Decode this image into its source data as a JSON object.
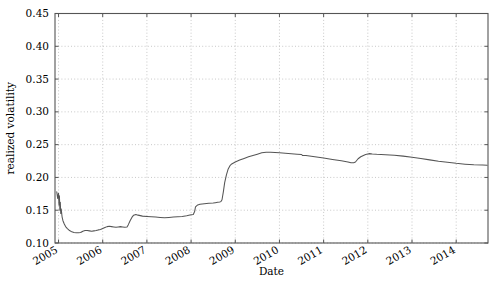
{
  "chart_data": {
    "type": "line",
    "title": "",
    "xlabel": "Date",
    "ylabel": "realized volatility",
    "xlim": [
      2004.92,
      2014.72
    ],
    "ylim": [
      0.1,
      0.45
    ],
    "grid": true,
    "legend": false,
    "legend_position": "none",
    "line_color": "#555555",
    "grid_color": "#b0b0b0",
    "axes_color": "#555555",
    "background_color": "#ffffff",
    "xticks": [
      2005,
      2006,
      2007,
      2008,
      2009,
      2010,
      2011,
      2012,
      2013,
      2014
    ],
    "xtick_labels": [
      "2005",
      "2006",
      "2007",
      "2008",
      "2009",
      "2010",
      "2011",
      "2012",
      "2013",
      "2014"
    ],
    "xtick_rotation": 30,
    "yticks": [
      0.1,
      0.15,
      0.2,
      0.25,
      0.3,
      0.35,
      0.4,
      0.45
    ],
    "ytick_labels": [
      "0.10",
      "0.15",
      "0.20",
      "0.25",
      "0.30",
      "0.35",
      "0.40",
      "0.45"
    ],
    "series": [
      {
        "name": "realized volatility",
        "x": [
          2004.96,
          2004.98,
          2005.0,
          2005.01,
          2005.02,
          2005.03,
          2005.04,
          2005.05,
          2005.06,
          2005.08,
          2005.1,
          2005.13,
          2005.16,
          2005.2,
          2005.25,
          2005.3,
          2005.35,
          2005.4,
          2005.45,
          2005.5,
          2005.55,
          2005.6,
          2005.65,
          2005.7,
          2005.75,
          2005.8,
          2005.85,
          2005.9,
          2005.95,
          2006.0,
          2006.05,
          2006.1,
          2006.15,
          2006.2,
          2006.25,
          2006.3,
          2006.35,
          2006.4,
          2006.45,
          2006.5,
          2006.55,
          2006.58,
          2006.62,
          2006.66,
          2006.7,
          2006.75,
          2006.8,
          2006.9,
          2007.0,
          2007.1,
          2007.2,
          2007.3,
          2007.4,
          2007.5,
          2007.6,
          2007.7,
          2007.8,
          2007.9,
          2008.0,
          2008.05,
          2008.08,
          2008.1,
          2008.15,
          2008.2,
          2008.3,
          2008.4,
          2008.5,
          2008.55,
          2008.6,
          2008.65,
          2008.68,
          2008.7,
          2008.73,
          2008.76,
          2008.8,
          2008.84,
          2008.88,
          2008.92,
          2008.96,
          2009.0,
          2009.1,
          2009.2,
          2009.3,
          2009.4,
          2009.5,
          2009.6,
          2009.7,
          2009.8,
          2009.9,
          2010.0,
          2010.2,
          2010.4,
          2010.5,
          2010.52,
          2010.55,
          2010.6,
          2010.8,
          2011.0,
          2011.2,
          2011.4,
          2011.55,
          2011.62,
          2011.68,
          2011.72,
          2011.78,
          2011.84,
          2011.9,
          2011.95,
          2012.0,
          2012.04,
          2012.1,
          2012.2,
          2012.4,
          2012.6,
          2012.8,
          2013.0,
          2013.2,
          2013.4,
          2013.6,
          2013.8,
          2014.0,
          2014.2,
          2014.4,
          2014.6,
          2014.7
        ],
        "y": [
          0.178,
          0.168,
          0.176,
          0.158,
          0.172,
          0.15,
          0.162,
          0.145,
          0.152,
          0.14,
          0.134,
          0.129,
          0.125,
          0.122,
          0.119,
          0.117,
          0.116,
          0.1155,
          0.1155,
          0.116,
          0.118,
          0.119,
          0.119,
          0.1185,
          0.118,
          0.1185,
          0.119,
          0.12,
          0.1205,
          0.122,
          0.1235,
          0.125,
          0.1255,
          0.125,
          0.1245,
          0.124,
          0.1245,
          0.125,
          0.1245,
          0.124,
          0.1245,
          0.128,
          0.134,
          0.139,
          0.1425,
          0.1435,
          0.1425,
          0.141,
          0.1405,
          0.14,
          0.1395,
          0.139,
          0.1385,
          0.139,
          0.1395,
          0.14,
          0.1405,
          0.1415,
          0.143,
          0.1435,
          0.148,
          0.155,
          0.158,
          0.159,
          0.16,
          0.1605,
          0.161,
          0.1615,
          0.162,
          0.1625,
          0.1635,
          0.166,
          0.178,
          0.192,
          0.204,
          0.213,
          0.218,
          0.2205,
          0.222,
          0.2235,
          0.2265,
          0.229,
          0.2315,
          0.2335,
          0.2355,
          0.2375,
          0.2385,
          0.2385,
          0.238,
          0.2375,
          0.2365,
          0.2355,
          0.235,
          0.2335,
          0.2335,
          0.2335,
          0.2315,
          0.2295,
          0.2275,
          0.2255,
          0.2235,
          0.2225,
          0.2225,
          0.2235,
          0.2285,
          0.2315,
          0.2335,
          0.2348,
          0.2358,
          0.2363,
          0.2358,
          0.2352,
          0.2345,
          0.2338,
          0.2325,
          0.2308,
          0.2288,
          0.2268,
          0.2248,
          0.2232,
          0.2215,
          0.2202,
          0.2192,
          0.2188,
          0.2185
        ]
      }
    ]
  }
}
